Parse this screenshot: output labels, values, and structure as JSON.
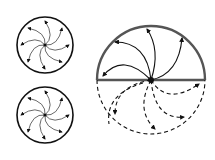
{
  "diagram": {
    "colors": {
      "background": "#ffffff",
      "stroke": "#111111",
      "outline": "#333333",
      "large_outline": "#555555"
    },
    "small_circles": [
      {
        "name": "top-left-vortex",
        "cx": 45,
        "cy": 45,
        "r": 28,
        "arrows": 8,
        "style": "solid"
      },
      {
        "name": "bottom-left-vortex",
        "cx": 45,
        "cy": 115,
        "r": 28,
        "arrows": 8,
        "style": "solid"
      }
    ],
    "large_circle": {
      "name": "half-vortex",
      "cx": 151,
      "cy": 80,
      "r": 54,
      "upper_half": {
        "style": "solid",
        "arrows": 4
      },
      "lower_half": {
        "style": "dashed",
        "arrows": 5
      },
      "diameter": {
        "style": "solid"
      }
    }
  }
}
